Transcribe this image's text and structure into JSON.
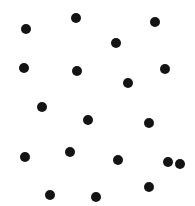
{
  "image": {
    "title": "Random dot pattern",
    "width": 195,
    "height": 206,
    "background_color": "#ffffff",
    "dot_color": "#141414",
    "dot_diameter": 10,
    "dot_count": 19
  },
  "chart_data": {
    "type": "scatter",
    "title": "",
    "xlabel": "",
    "ylabel": "",
    "xlim": [
      0,
      195
    ],
    "ylim": [
      0,
      206
    ],
    "grid": false,
    "legend": "none",
    "marker": "circle",
    "marker_size": 10,
    "marker_color": "#141414",
    "background_color": "#ffffff",
    "points": [
      {
        "x": 26,
        "y": 29
      },
      {
        "x": 76,
        "y": 18
      },
      {
        "x": 116,
        "y": 43
      },
      {
        "x": 155,
        "y": 22
      },
      {
        "x": 24,
        "y": 68
      },
      {
        "x": 77,
        "y": 71
      },
      {
        "x": 128,
        "y": 83
      },
      {
        "x": 165,
        "y": 69
      },
      {
        "x": 42,
        "y": 107
      },
      {
        "x": 88,
        "y": 120
      },
      {
        "x": 149,
        "y": 123
      },
      {
        "x": 25,
        "y": 157
      },
      {
        "x": 70,
        "y": 152
      },
      {
        "x": 118,
        "y": 160
      },
      {
        "x": 168,
        "y": 162
      },
      {
        "x": 50,
        "y": 195
      },
      {
        "x": 96,
        "y": 197
      },
      {
        "x": 149,
        "y": 187
      },
      {
        "x": 180,
        "y": 164
      }
    ]
  }
}
